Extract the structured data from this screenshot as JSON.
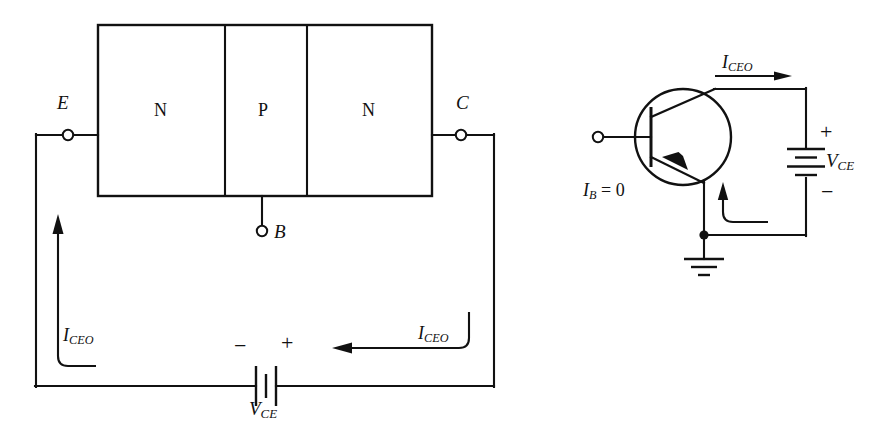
{
  "figure": {
    "stroke_color": "#111111",
    "background_color": "#ffffff"
  },
  "left_diagram": {
    "name": "npn-block-structure-circuit",
    "regions": [
      {
        "label": "N",
        "type": "n-type"
      },
      {
        "label": "P",
        "type": "p-type"
      },
      {
        "label": "N",
        "type": "n-type"
      }
    ],
    "terminals": [
      {
        "label": "E",
        "name": "emitter"
      },
      {
        "label": "C",
        "name": "collector"
      },
      {
        "label": "B",
        "name": "base"
      }
    ],
    "currents": [
      {
        "label": "I",
        "sub": "CEO",
        "name": "emitter-branch-current"
      },
      {
        "label": "I",
        "sub": "CEO",
        "name": "collector-branch-current"
      }
    ],
    "source": {
      "label": "V",
      "sub": "CE",
      "positive": "+",
      "negative": "−"
    }
  },
  "right_diagram": {
    "name": "npn-transistor-symbol-circuit",
    "current_top": {
      "label": "I",
      "sub": "CEO"
    },
    "base_condition": {
      "label": "I",
      "sub": "B",
      "value": "= 0"
    },
    "source": {
      "label": "V",
      "sub": "CE",
      "positive": "+",
      "negative": "−"
    },
    "ground": {
      "name": "ground-symbol"
    }
  }
}
